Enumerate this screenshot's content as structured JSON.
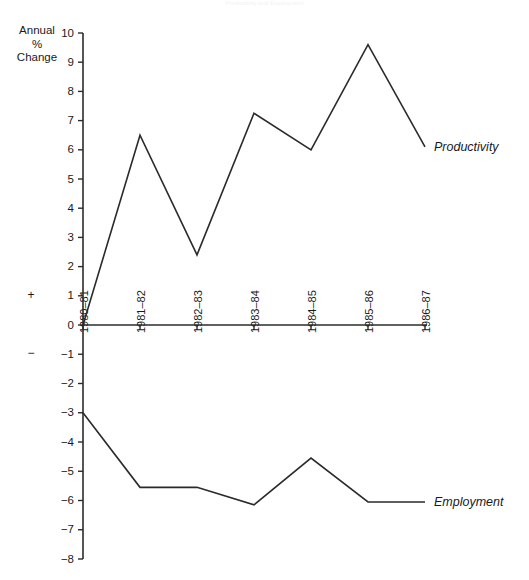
{
  "figure": {
    "title": "Productivity and Employment",
    "axis_caption": "Annual\n%\nChange",
    "positive_sign": "+",
    "negative_sign": "−"
  },
  "chart_data": {
    "type": "line",
    "title": "Productivity and Employment",
    "xlabel": "",
    "ylabel": "Annual % Change",
    "ylim": [
      -8,
      10
    ],
    "ytick_step": 1,
    "grid": false,
    "legend": "inline-right-of-line-end",
    "categories": [
      "1980–81",
      "1981–82",
      "1982–83",
      "1983–84",
      "1984–85",
      "1985–86",
      "1986–87"
    ],
    "yticks": [
      10,
      9,
      8,
      7,
      6,
      5,
      4,
      3,
      2,
      1,
      0,
      -1,
      -2,
      -3,
      -4,
      -5,
      -6,
      -7,
      -8
    ],
    "ytick_labels": [
      "10",
      "9",
      "8",
      "7",
      "6",
      "5",
      "4",
      "3",
      "2",
      "1",
      "0",
      "−1",
      "−2",
      "−3",
      "−4",
      "−5",
      "−6",
      "−7",
      "−8"
    ],
    "series": [
      {
        "name": "Productivity",
        "color": "#2b2b2b",
        "values": [
          0.0,
          6.5,
          2.4,
          7.25,
          6.0,
          9.6,
          6.1
        ]
      },
      {
        "name": "Employment",
        "color": "#2b2b2b",
        "values": [
          -3.0,
          -5.55,
          -5.55,
          -6.15,
          -4.55,
          -6.05,
          -6.05
        ]
      }
    ]
  }
}
